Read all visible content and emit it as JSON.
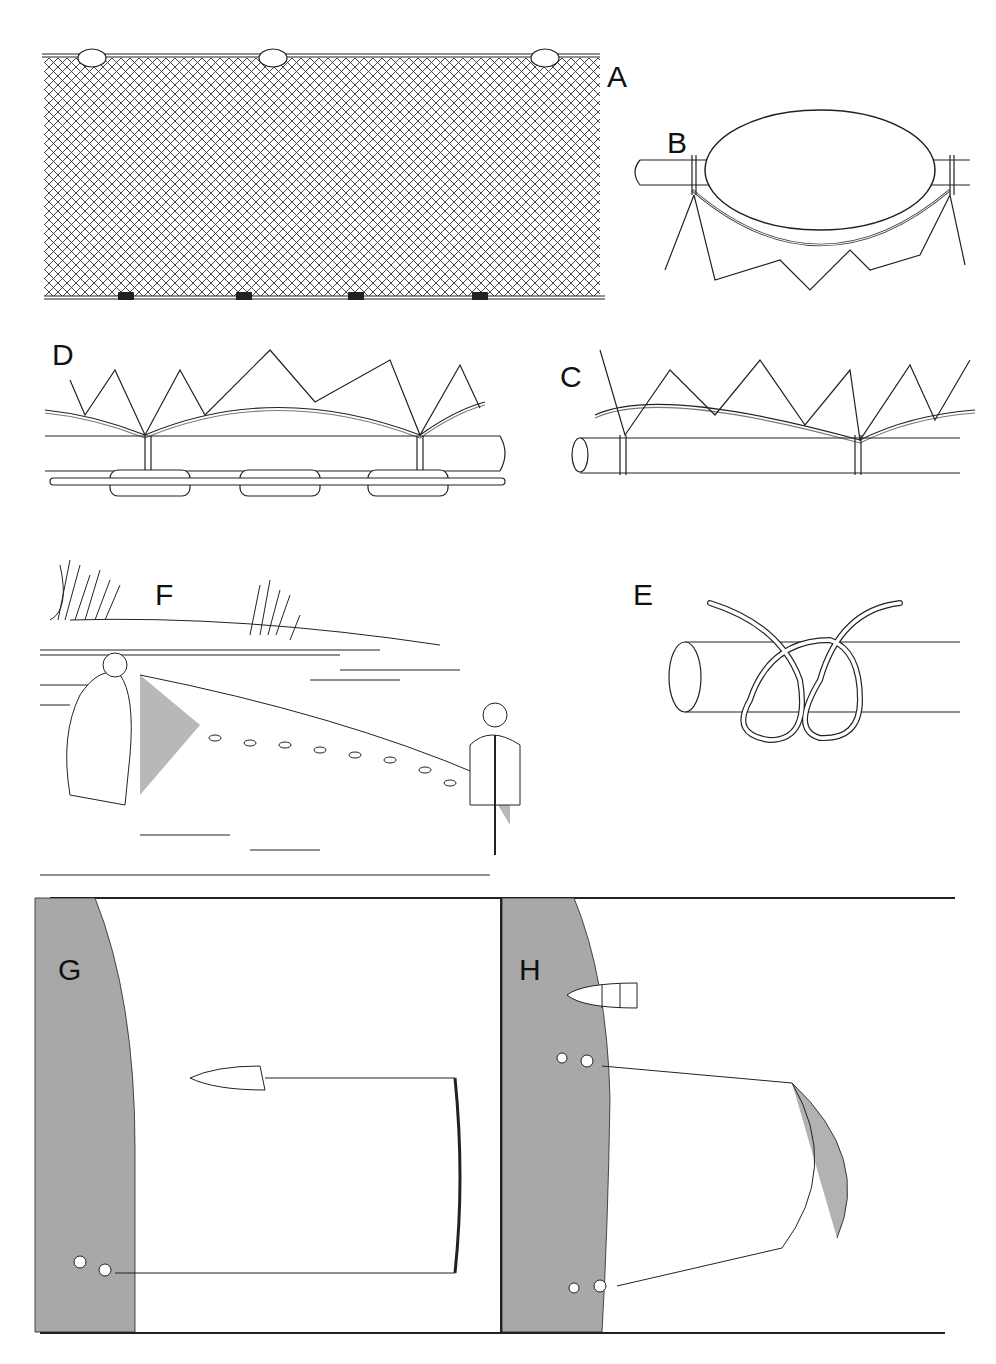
{
  "figure": {
    "panels": [
      {
        "id": "A",
        "label": "A",
        "description": "Seine net panel with floats on top line and lead weights on bottom line"
      },
      {
        "id": "B",
        "label": "B",
        "description": "Detail of float attached to float line with netting"
      },
      {
        "id": "C",
        "label": "C",
        "description": "Detail of netting hung on float line rope"
      },
      {
        "id": "D",
        "label": "D",
        "description": "Detail of netting hung on lead line with chain"
      },
      {
        "id": "E",
        "label": "E",
        "description": "Knot detail (clove hitch) on rope"
      },
      {
        "id": "F",
        "label": "F",
        "description": "Two people hauling seine net in shallow water"
      },
      {
        "id": "G",
        "label": "G",
        "description": "Plan view: boat setting net from shore"
      },
      {
        "id": "H",
        "label": "H",
        "description": "Plan view: net hauled toward shore in arc"
      }
    ],
    "colors": {
      "ink": "#1a1a1a",
      "shore": "#a8a8a8",
      "background": "#ffffff"
    }
  }
}
